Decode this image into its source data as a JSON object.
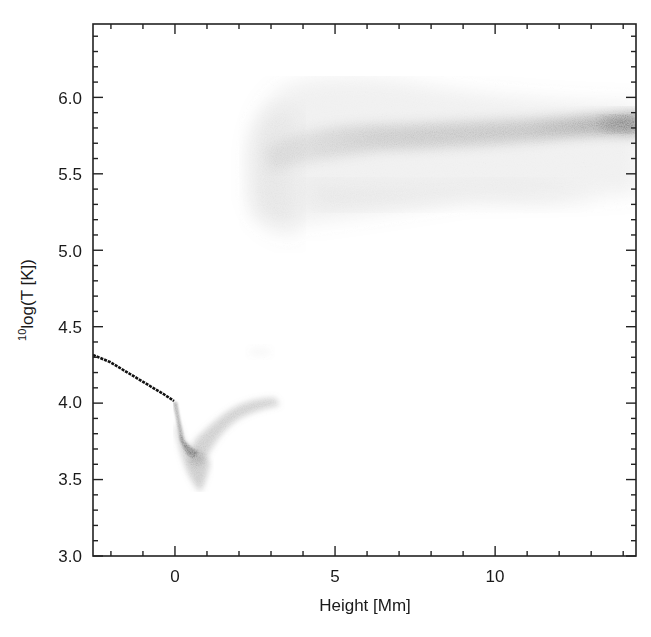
{
  "chart_data": {
    "type": "heatmap",
    "title": "",
    "xlabel": "Height [Mm]",
    "ylabel_sup": "10",
    "ylabel": "log(T [K])",
    "xlim": [
      -2.56,
      14.4
    ],
    "ylim": [
      3.0,
      6.48
    ],
    "x_ticks": [
      0,
      5,
      10
    ],
    "x_tick_labels": [
      "0",
      "5",
      "10"
    ],
    "x_minor_step": 1,
    "y_ticks": [
      3.0,
      3.5,
      4.0,
      4.5,
      5.0,
      5.5,
      6.0
    ],
    "y_tick_labels": [
      "3.0",
      "3.5",
      "4.0",
      "4.5",
      "5.0",
      "5.5",
      "6.0"
    ],
    "y_minor_step": 0.1,
    "grid": false,
    "colormap": "grayscale (white = low density, black = high density)",
    "features": [
      {
        "name": "photosphere-line",
        "description": "sharp dark line",
        "points": [
          [
            -2.56,
            4.31
          ],
          [
            -1.5,
            4.21
          ],
          [
            -0.5,
            4.09
          ],
          [
            0.0,
            4.02
          ]
        ]
      },
      {
        "name": "temperature-minimum",
        "description": "dark dip",
        "points": [
          [
            0.0,
            4.0
          ],
          [
            0.2,
            3.8
          ],
          [
            0.4,
            3.68
          ],
          [
            0.8,
            3.6
          ],
          [
            1.0,
            3.45
          ]
        ]
      },
      {
        "name": "chromosphere-rise",
        "description": "grey band rising",
        "points": [
          [
            0.8,
            3.6
          ],
          [
            1.5,
            3.8
          ],
          [
            2.2,
            3.98
          ],
          [
            3.2,
            4.01
          ]
        ]
      },
      {
        "name": "corona-band",
        "description": "diffuse grey band, darkest near right edge",
        "points": [
          [
            2.5,
            5.55
          ],
          [
            5.0,
            5.75
          ],
          [
            8.0,
            5.78
          ],
          [
            12.0,
            5.8
          ],
          [
            14.4,
            5.83
          ]
        ]
      },
      {
        "name": "corona-envelope",
        "y_range": [
          5.1,
          6.08
        ],
        "x_range": [
          2.3,
          14.4
        ]
      }
    ]
  }
}
